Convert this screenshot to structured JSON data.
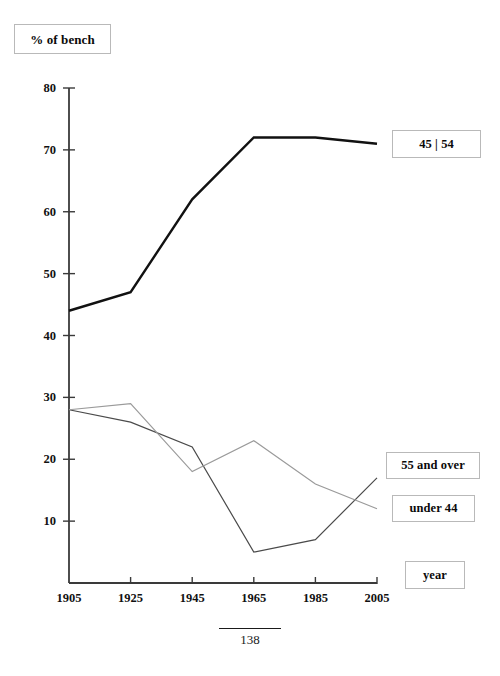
{
  "page": {
    "number": "138",
    "background_color": "#ffffff"
  },
  "title": {
    "text": "% of bench"
  },
  "axis_caption": {
    "text": "year"
  },
  "legend": {
    "position": "right",
    "items": [
      {
        "label": "45 | 54",
        "color": "#111111",
        "width": "thick"
      },
      {
        "label": "55 and over",
        "color": "#4a4a4a",
        "width": "thin"
      },
      {
        "label": "under 44",
        "color": "#9a9a9a",
        "width": "thin"
      }
    ]
  },
  "axes": {
    "y": {
      "label": "% of bench",
      "min": 0,
      "max": 80,
      "ticks": [
        10,
        20,
        30,
        40,
        50,
        60,
        70,
        80
      ],
      "tick_labels": [
        "10",
        "20",
        "30",
        "40",
        "50",
        "60",
        "70",
        "80"
      ]
    },
    "x": {
      "label": "year",
      "ticks": [
        1905,
        1925,
        1945,
        1965,
        1985,
        2005
      ],
      "tick_labels": [
        "1905",
        "1925",
        "1945",
        "1965",
        "1985",
        "2005"
      ]
    }
  },
  "chart_data": {
    "type": "line",
    "title": "% of bench",
    "xlabel": "year",
    "ylabel": "% of bench",
    "categories": [
      1905,
      1925,
      1945,
      1965,
      1985,
      2005
    ],
    "x": [
      1905,
      1925,
      1945,
      1965,
      1985,
      2005
    ],
    "xlim": [
      1905,
      2005
    ],
    "ylim": [
      0,
      80
    ],
    "grid": false,
    "legend_position": "right",
    "series": [
      {
        "name": "45 | 54",
        "color": "#111111",
        "linewidth": 2.4,
        "values": [
          44,
          47,
          62,
          72,
          72,
          71
        ]
      },
      {
        "name": "55 and over",
        "color": "#4a4a4a",
        "linewidth": 1.2,
        "values": [
          28,
          26,
          22,
          5,
          7,
          17
        ]
      },
      {
        "name": "under 44",
        "color": "#9a9a9a",
        "linewidth": 1.2,
        "values": [
          28,
          29,
          18,
          23,
          16,
          12
        ]
      }
    ]
  }
}
